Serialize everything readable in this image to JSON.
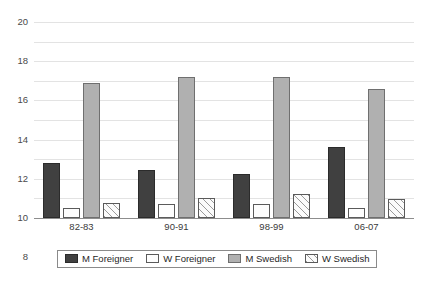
{
  "chart_data": {
    "type": "bar",
    "title": "",
    "subtitle": "",
    "xlabel": "",
    "ylabel": "",
    "ylim": [
      0,
      20
    ],
    "yticks": [
      0,
      2,
      4,
      6,
      8,
      10,
      12,
      14,
      16,
      18,
      20
    ],
    "grid": true,
    "legend_position": "bottom",
    "categories": [
      "82-83",
      "90-91",
      "98-99",
      "06-07"
    ],
    "series": [
      {
        "name": "M Foreigner",
        "color": "#404040",
        "pattern": "solid-dark",
        "values": [
          5.6,
          4.9,
          4.5,
          7.2
        ]
      },
      {
        "name": "W Foreigner",
        "color": "#fdfdfd",
        "pattern": "white-outline",
        "values": [
          1.0,
          1.4,
          1.4,
          1.0
        ]
      },
      {
        "name": "M Swedish",
        "color": "#b0b0b0",
        "pattern": "solid-gray",
        "values": [
          13.8,
          14.4,
          14.4,
          13.2
        ]
      },
      {
        "name": "W Swedish",
        "color": "#fbfbfb",
        "pattern": "diagonal-hatch",
        "values": [
          1.5,
          2.0,
          2.5,
          1.9
        ]
      }
    ]
  },
  "legend": {
    "items": [
      {
        "label": "M Foreigner"
      },
      {
        "label": "W Foreigner"
      },
      {
        "label": "M Swedish"
      },
      {
        "label": "W Swedish"
      }
    ]
  }
}
